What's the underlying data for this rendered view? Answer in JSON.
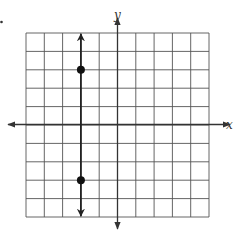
{
  "question_marker": ".",
  "axes": {
    "x_label": "x",
    "y_label": "y"
  },
  "colors": {
    "grid": "#555555",
    "axis": "#333333",
    "line": "#222222",
    "point": "#111111"
  },
  "chart_data": {
    "type": "line",
    "title": "",
    "xlabel": "x",
    "ylabel": "y",
    "xlim": [
      -5,
      5
    ],
    "ylim": [
      -5,
      5
    ],
    "grid": true,
    "tick_labels": false,
    "series": [
      {
        "name": "vertical line x = -2",
        "x": [
          -2,
          -2
        ],
        "y": [
          -5,
          5
        ],
        "arrows": "both"
      }
    ],
    "points": [
      {
        "x": -2,
        "y": 3
      },
      {
        "x": -2,
        "y": -3
      }
    ]
  }
}
